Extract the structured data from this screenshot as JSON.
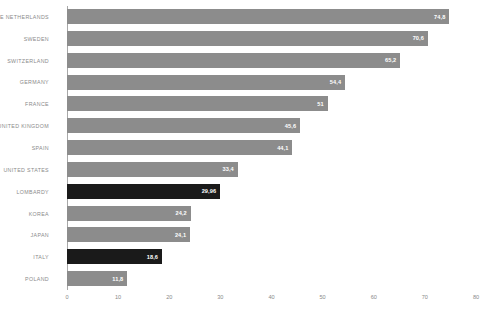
{
  "chart_data": {
    "type": "bar",
    "orientation": "horizontal",
    "title": "",
    "xlabel": "",
    "ylabel": "",
    "xlim": [
      0,
      80
    ],
    "xticks": [
      "0",
      "10",
      "20",
      "30",
      "40",
      "50",
      "60",
      "70",
      "80"
    ],
    "grid": false,
    "legend": null,
    "categories": [
      "THE NETHERLANDS",
      "SWEDEN",
      "SWITZERLAND",
      "GERMANY",
      "FRANCE",
      "UNITED KINGDOM",
      "SPAIN",
      "UNITED STATES",
      "LOMBARDY",
      "KOREA",
      "JAPAN",
      "ITALY",
      "POLAND"
    ],
    "values": [
      74.8,
      70.6,
      65.2,
      54.4,
      51,
      45.6,
      44.1,
      33.4,
      29.96,
      24.2,
      24.1,
      18.6,
      11.8
    ],
    "value_labels": [
      "74,8",
      "70,6",
      "65,2",
      "54,4",
      "51",
      "45,6",
      "44,1",
      "33,4",
      "29,96",
      "24,2",
      "24,1",
      "18,6",
      "11,8"
    ],
    "highlighted": [
      false,
      false,
      false,
      false,
      false,
      false,
      false,
      false,
      true,
      false,
      false,
      true,
      false
    ],
    "colors": {
      "bar": "#8c8c8c",
      "bar_highlight": "#1a1a1a",
      "value_text": "#ffffff",
      "category_text": "#8a8a8a",
      "axis": "#a8a8a8",
      "background": "#ffffff"
    }
  },
  "caption": {
    "text": ""
  }
}
